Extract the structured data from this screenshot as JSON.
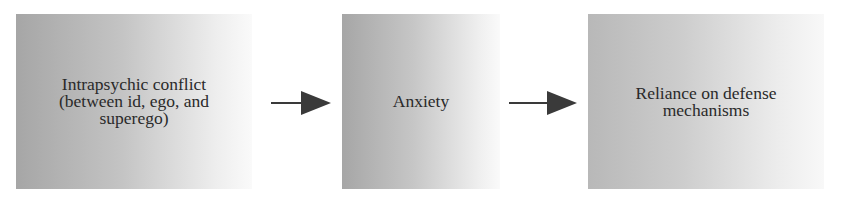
{
  "diagram": {
    "type": "flowchart",
    "direction": "left-to-right",
    "nodes": [
      {
        "id": "conflict",
        "lines": [
          "Intrapsychic conflict",
          "(between id, ego, and",
          "superego)"
        ]
      },
      {
        "id": "anxiety",
        "lines": [
          "Anxiety"
        ]
      },
      {
        "id": "defense",
        "lines": [
          "Reliance on defense",
          "mechanisms"
        ]
      }
    ],
    "edges": [
      {
        "from": "conflict",
        "to": "anxiety"
      },
      {
        "from": "anxiety",
        "to": "defense"
      }
    ],
    "colors": {
      "box_dark": "#a6a6a6",
      "box_light": "#fafafa",
      "arrow": "#3a3a3a",
      "text": "#2a2a2a"
    }
  }
}
